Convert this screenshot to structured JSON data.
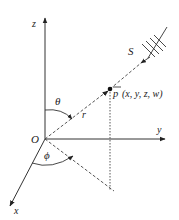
{
  "diagram": {
    "type": "spherical-coordinates",
    "colors": {
      "line": "#333333",
      "background": "#ffffff"
    },
    "labels": {
      "z_axis": "z",
      "y_axis": "y",
      "x_axis": "x",
      "origin": "O",
      "theta": "θ",
      "phi": "ϕ",
      "radius": "r",
      "source": "S",
      "point_bar": "p",
      "point_coords": "(x, y, z, w)"
    },
    "nodes": [
      {
        "id": "origin",
        "label": "O",
        "x": 45,
        "y": 139
      },
      {
        "id": "point",
        "label": "p (x, y, z, w)",
        "x": 110,
        "y": 89
      },
      {
        "id": "source",
        "label": "S",
        "x": 150,
        "y": 40
      },
      {
        "id": "projection-foot",
        "x": 110,
        "y": 190
      }
    ],
    "edges": [
      {
        "from": "origin",
        "to": "z-axis-end",
        "style": "solid",
        "arrow": true,
        "label": "z"
      },
      {
        "from": "origin",
        "to": "y-axis-end",
        "style": "solid",
        "arrow": true,
        "label": "y"
      },
      {
        "from": "origin",
        "to": "x-axis-end",
        "style": "solid",
        "arrow": true,
        "label": "x"
      },
      {
        "from": "origin",
        "to": "point",
        "style": "dashed",
        "label": "r"
      },
      {
        "from": "source",
        "to": "point",
        "style": "solid+dashed",
        "arrow": true
      },
      {
        "from": "point",
        "to": "projection-foot",
        "style": "dotted"
      },
      {
        "from": "origin",
        "to": "projection-foot",
        "style": "dashed"
      }
    ],
    "angles": [
      {
        "label": "θ",
        "between": [
          "z-axis",
          "r"
        ]
      },
      {
        "label": "ϕ",
        "between": [
          "x-axis",
          "projection"
        ]
      }
    ]
  }
}
